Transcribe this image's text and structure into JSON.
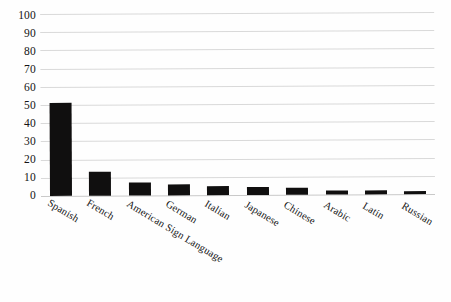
{
  "chart_data": {
    "type": "bar",
    "title": "",
    "xlabel": "",
    "ylabel": "",
    "ylim": [
      0,
      100
    ],
    "ytick_step": 10,
    "grid": true,
    "legend": "none",
    "bar_color": "#100f0f",
    "gridline_color": "#d9d9d9",
    "categories": [
      "Spanish",
      "French",
      "American Sign Language",
      "German",
      "Italian",
      "Japanese",
      "Chinese",
      "Arabic",
      "Latin",
      "Russian"
    ],
    "values": [
      51,
      13,
      7,
      6,
      5,
      4.5,
      4,
      2,
      2,
      1.5
    ],
    "ytick_labels": [
      "0",
      "10",
      "20",
      "30",
      "40",
      "50",
      "60",
      "70",
      "80",
      "90",
      "100"
    ]
  }
}
